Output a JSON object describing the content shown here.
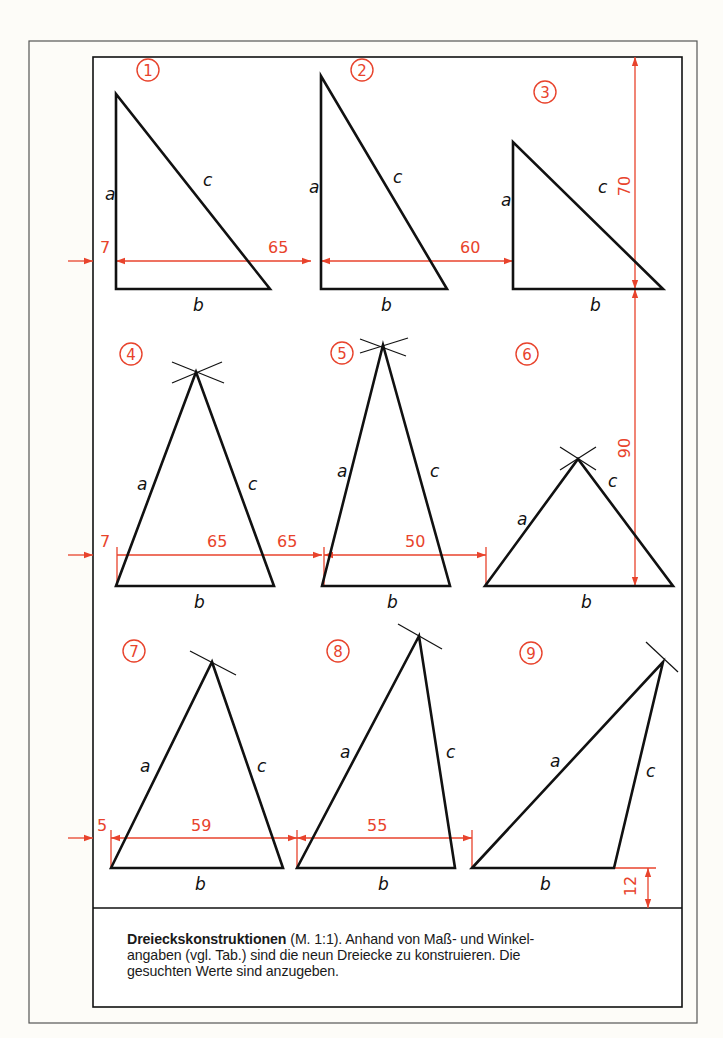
{
  "frame": {
    "outer": {
      "x": 29,
      "y": 41,
      "w": 668,
      "h": 982,
      "color": "#555555"
    },
    "inner": {
      "x": 93,
      "y": 57,
      "w": 589,
      "h": 950,
      "color": "#111111"
    },
    "divider_y": 908
  },
  "colors": {
    "line": "#111111",
    "dimension": "#e8432c",
    "background": "#fdfcf8"
  },
  "triangles": [
    {
      "id": "1",
      "label": "1",
      "circle": [
        148,
        70
      ],
      "pts": [
        [
          116,
          94
        ],
        [
          116,
          289
        ],
        [
          270,
          289
        ]
      ],
      "a": [
        105,
        200
      ],
      "b": [
        193,
        311
      ],
      "c": [
        203,
        186
      ]
    },
    {
      "id": "2",
      "label": "2",
      "circle": [
        362,
        70
      ],
      "pts": [
        [
          321,
          76
        ],
        [
          321,
          289
        ],
        [
          447,
          289
        ]
      ],
      "a": [
        309,
        193
      ],
      "b": [
        381,
        311
      ],
      "c": [
        393,
        183
      ]
    },
    {
      "id": "3",
      "label": "3",
      "circle": [
        545,
        92
      ],
      "pts": [
        [
          513,
          142
        ],
        [
          513,
          289
        ],
        [
          663,
          289
        ]
      ],
      "a": [
        501,
        206
      ],
      "b": [
        590,
        311
      ],
      "c": [
        598,
        193
      ]
    },
    {
      "id": "4",
      "label": "4",
      "circle": [
        131,
        354
      ],
      "pts": [
        [
          116,
          586
        ],
        [
          196,
          372
        ],
        [
          274,
          586
        ]
      ],
      "a": [
        137,
        490
      ],
      "b": [
        194,
        608
      ],
      "c": [
        248,
        490
      ],
      "arcs": [
        [
          172,
          362,
          224,
          383
        ],
        [
          172,
          383,
          222,
          362
        ]
      ]
    },
    {
      "id": "5",
      "label": "5",
      "circle": [
        342,
        353
      ],
      "pts": [
        [
          322,
          586
        ],
        [
          383,
          345
        ],
        [
          450,
          586
        ]
      ],
      "a": [
        337,
        477
      ],
      "b": [
        387,
        608
      ],
      "c": [
        430,
        477
      ],
      "arcs": [
        [
          360,
          339,
          406,
          356
        ],
        [
          360,
          353,
          408,
          338
        ]
      ]
    },
    {
      "id": "6",
      "label": "6",
      "circle": [
        527,
        354
      ],
      "pts": [
        [
          485,
          586
        ],
        [
          578,
          459
        ],
        [
          673,
          586
        ]
      ],
      "a": [
        517,
        525
      ],
      "b": [
        581,
        608
      ],
      "c": [
        608,
        487
      ],
      "arcs": [
        [
          560,
          447,
          596,
          470
        ],
        [
          560,
          470,
          596,
          447
        ]
      ]
    },
    {
      "id": "7",
      "label": "7",
      "circle": [
        134,
        651
      ],
      "pts": [
        [
          111,
          868
        ],
        [
          212,
          662
        ],
        [
          283,
          868
        ]
      ],
      "a": [
        140,
        772
      ],
      "b": [
        195,
        890
      ],
      "c": [
        257,
        772
      ],
      "arcs": [
        [
          190,
          651,
          236,
          675
        ]
      ]
    },
    {
      "id": "8",
      "label": "8",
      "circle": [
        338,
        651
      ],
      "pts": [
        [
          297,
          868
        ],
        [
          419,
          636
        ],
        [
          455,
          868
        ]
      ],
      "a": [
        340,
        758
      ],
      "b": [
        378,
        890
      ],
      "c": [
        446,
        758
      ],
      "arcs": [
        [
          398,
          624,
          442,
          649
        ]
      ]
    },
    {
      "id": "9",
      "label": "9",
      "circle": [
        531,
        653
      ],
      "pts": [
        [
          472,
          868
        ],
        [
          663,
          662
        ],
        [
          614,
          868
        ]
      ],
      "a": [
        550,
        767
      ],
      "b": [
        540,
        890
      ],
      "c": [
        646,
        777
      ],
      "arcs": [
        [
          646,
          642,
          678,
          672
        ]
      ]
    }
  ],
  "dimensions": {
    "row1": {
      "y": 261,
      "values": [
        {
          "text": "7",
          "x": 100,
          "y": 253
        },
        {
          "text": "65",
          "x": 268,
          "y": 253
        },
        {
          "text": "60",
          "x": 460,
          "y": 253
        }
      ]
    },
    "row2": {
      "y": 555,
      "values": [
        {
          "text": "7",
          "x": 100,
          "y": 547
        },
        {
          "text": "65",
          "x": 207,
          "y": 547
        },
        {
          "text": "65",
          "x": 277,
          "y": 547
        },
        {
          "text": "50",
          "x": 405,
          "y": 547
        }
      ]
    },
    "row3": {
      "y": 838,
      "values": [
        {
          "text": "5",
          "x": 97,
          "y": 831
        },
        {
          "text": "59",
          "x": 191,
          "y": 831
        },
        {
          "text": "55",
          "x": 367,
          "y": 831
        }
      ]
    },
    "vertical": [
      {
        "text": "70",
        "x": 630,
        "y": 186
      },
      {
        "text": "90",
        "x": 630,
        "y": 448
      },
      {
        "text": "12",
        "x": 636,
        "y": 886
      }
    ]
  },
  "caption": {
    "bold": "Dreieckskonstruktionen",
    "text": " (M. 1:1). Anhand von Maß- und Winkelangaben (vgl. Tab.) sind die neun Dreiecke zu konstruieren. Die gesuchten Werte sind anzugeben.",
    "line1_rest": " (M. 1:1). Anhand von Maß- und Winkel-",
    "line2": "angaben (vgl. Tab.) sind die neun Dreiecke zu konstruieren. Die",
    "line3": "gesuchten Werte sind anzugeben."
  },
  "side_labels": {
    "a": "a",
    "b": "b",
    "c": "c"
  }
}
